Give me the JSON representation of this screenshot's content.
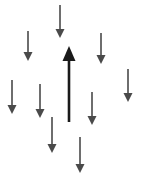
{
  "canvas": {
    "width": 143,
    "height": 180,
    "background_color": "#ffffff"
  },
  "diagram": {
    "name": "arrows-diagram",
    "down_arrow_color": "#4a4a4a",
    "up_arrow_color": "#1a1a1a",
    "down_arrow_count": 9,
    "up_arrow_count": 1
  },
  "arrows": [
    {
      "id": "down-arrow-top-center",
      "direction": "down",
      "color": "#4a4a4a",
      "x": 60,
      "y_start": 5,
      "y_tip": 38,
      "shaft_width": 1.6,
      "head_width": 9,
      "head_length": 9
    },
    {
      "id": "down-arrow-upper-left",
      "direction": "down",
      "color": "#4a4a4a",
      "x": 28,
      "y_start": 31,
      "y_tip": 61,
      "shaft_width": 1.6,
      "head_width": 9,
      "head_length": 9
    },
    {
      "id": "down-arrow-upper-right",
      "direction": "down",
      "color": "#4a4a4a",
      "x": 101,
      "y_start": 33,
      "y_tip": 64,
      "shaft_width": 1.6,
      "head_width": 9,
      "head_length": 9
    },
    {
      "id": "down-arrow-far-right",
      "direction": "down",
      "color": "#4a4a4a",
      "x": 128,
      "y_start": 69,
      "y_tip": 102,
      "shaft_width": 1.6,
      "head_width": 9,
      "head_length": 9
    },
    {
      "id": "down-arrow-far-left",
      "direction": "down",
      "color": "#4a4a4a",
      "x": 12,
      "y_start": 80,
      "y_tip": 114,
      "shaft_width": 1.6,
      "head_width": 9,
      "head_length": 9
    },
    {
      "id": "down-arrow-mid-left",
      "direction": "down",
      "color": "#4a4a4a",
      "x": 40,
      "y_start": 84,
      "y_tip": 118,
      "shaft_width": 1.6,
      "head_width": 9,
      "head_length": 9
    },
    {
      "id": "down-arrow-mid-right",
      "direction": "down",
      "color": "#4a4a4a",
      "x": 92,
      "y_start": 92,
      "y_tip": 125,
      "shaft_width": 1.6,
      "head_width": 9,
      "head_length": 9
    },
    {
      "id": "down-arrow-lower-left",
      "direction": "down",
      "color": "#4a4a4a",
      "x": 52,
      "y_start": 117,
      "y_tip": 153,
      "shaft_width": 1.6,
      "head_width": 9,
      "head_length": 9
    },
    {
      "id": "down-arrow-bottom-center",
      "direction": "down",
      "color": "#4a4a4a",
      "x": 80,
      "y_start": 137,
      "y_tip": 173,
      "shaft_width": 1.6,
      "head_width": 9,
      "head_length": 9
    },
    {
      "id": "up-arrow-center",
      "direction": "up",
      "color": "#1a1a1a",
      "x": 69,
      "y_start": 122,
      "y_tip": 46,
      "shaft_width": 2.6,
      "head_width": 13,
      "head_length": 15
    }
  ]
}
